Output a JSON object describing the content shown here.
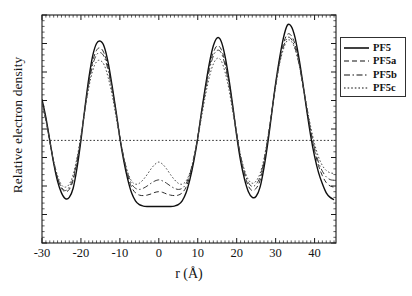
{
  "chart_data": {
    "type": "line",
    "title": "",
    "subtitle": "",
    "xlabel": "r (Å)",
    "ylabel": "Relative electron density",
    "xlim": [
      -30,
      45.5
    ],
    "ylim": [
      0,
      1.0
    ],
    "xticks": [
      -30,
      -20,
      -10,
      0,
      10,
      20,
      30,
      40
    ],
    "xtick_labels": [
      "-30",
      "-20",
      "-10",
      "0",
      "10",
      "20",
      "30",
      "40"
    ],
    "yticks": [],
    "ytick_labels": [],
    "grid": false,
    "legend_position": "outside right top",
    "reference_line": {
      "orientation": "horizontal",
      "value": 0.45,
      "style": "dotted",
      "label": ""
    },
    "x": [
      -30,
      -29,
      -28,
      -27,
      -26,
      -25,
      -24,
      -23,
      -22,
      -21,
      -20,
      -19,
      -18,
      -17,
      -16,
      -15,
      -14,
      -13,
      -12,
      -11,
      -10,
      -9,
      -8,
      -7,
      -6,
      -5,
      -4,
      -3,
      -2,
      -1,
      0,
      1,
      2,
      3,
      4,
      5,
      6,
      7,
      8,
      9,
      10,
      11,
      12,
      13,
      14,
      15,
      16,
      17,
      18,
      19,
      20,
      21,
      22,
      23,
      24,
      25,
      26,
      27,
      28,
      29,
      30,
      31,
      32,
      33,
      34,
      35,
      36,
      37,
      38,
      39,
      40,
      41,
      42,
      43,
      44,
      45
    ],
    "series": [
      {
        "name": "PF5",
        "style": "solid",
        "color": "#101010",
        "values": [
          0.63,
          0.55,
          0.45,
          0.35,
          0.27,
          0.22,
          0.195,
          0.2,
          0.24,
          0.33,
          0.45,
          0.59,
          0.72,
          0.82,
          0.875,
          0.885,
          0.86,
          0.79,
          0.69,
          0.58,
          0.46,
          0.36,
          0.28,
          0.22,
          0.185,
          0.168,
          0.162,
          0.16,
          0.16,
          0.16,
          0.16,
          0.16,
          0.16,
          0.16,
          0.162,
          0.168,
          0.185,
          0.22,
          0.28,
          0.36,
          0.46,
          0.58,
          0.69,
          0.79,
          0.865,
          0.9,
          0.885,
          0.82,
          0.72,
          0.6,
          0.47,
          0.36,
          0.28,
          0.225,
          0.2,
          0.205,
          0.245,
          0.33,
          0.44,
          0.57,
          0.7,
          0.81,
          0.9,
          0.955,
          0.95,
          0.9,
          0.81,
          0.7,
          0.58,
          0.47,
          0.38,
          0.31,
          0.26,
          0.22,
          0.2,
          0.19
        ]
      },
      {
        "name": "PF5a",
        "style": "dashed",
        "color": "#2a2a2a",
        "values": [
          0.62,
          0.545,
          0.45,
          0.355,
          0.285,
          0.24,
          0.225,
          0.235,
          0.275,
          0.355,
          0.46,
          0.585,
          0.705,
          0.795,
          0.845,
          0.855,
          0.83,
          0.77,
          0.68,
          0.575,
          0.465,
          0.37,
          0.295,
          0.245,
          0.22,
          0.21,
          0.208,
          0.21,
          0.215,
          0.222,
          0.225,
          0.222,
          0.215,
          0.21,
          0.208,
          0.21,
          0.22,
          0.245,
          0.295,
          0.37,
          0.465,
          0.575,
          0.68,
          0.775,
          0.835,
          0.865,
          0.85,
          0.795,
          0.705,
          0.595,
          0.48,
          0.375,
          0.3,
          0.25,
          0.23,
          0.24,
          0.275,
          0.35,
          0.455,
          0.575,
          0.695,
          0.8,
          0.875,
          0.915,
          0.91,
          0.87,
          0.795,
          0.695,
          0.59,
          0.49,
          0.405,
          0.34,
          0.295,
          0.265,
          0.25,
          0.245
        ]
      },
      {
        "name": "PF5b",
        "style": "dashdot",
        "color": "#3a3a3a",
        "values": [
          0.615,
          0.54,
          0.445,
          0.355,
          0.285,
          0.245,
          0.23,
          0.245,
          0.285,
          0.365,
          0.465,
          0.585,
          0.695,
          0.78,
          0.825,
          0.835,
          0.815,
          0.755,
          0.67,
          0.57,
          0.465,
          0.375,
          0.305,
          0.26,
          0.24,
          0.235,
          0.24,
          0.25,
          0.262,
          0.272,
          0.277,
          0.272,
          0.262,
          0.25,
          0.24,
          0.235,
          0.24,
          0.26,
          0.305,
          0.375,
          0.465,
          0.57,
          0.67,
          0.76,
          0.82,
          0.845,
          0.835,
          0.78,
          0.695,
          0.59,
          0.48,
          0.38,
          0.31,
          0.265,
          0.248,
          0.258,
          0.29,
          0.36,
          0.46,
          0.575,
          0.69,
          0.79,
          0.86,
          0.9,
          0.895,
          0.855,
          0.785,
          0.69,
          0.59,
          0.495,
          0.415,
          0.355,
          0.315,
          0.29,
          0.278,
          0.275
        ]
      },
      {
        "name": "PF5c",
        "style": "dotted",
        "color": "#4a4a4a",
        "values": [
          0.605,
          0.535,
          0.445,
          0.36,
          0.295,
          0.255,
          0.245,
          0.258,
          0.3,
          0.375,
          0.47,
          0.58,
          0.68,
          0.755,
          0.795,
          0.8,
          0.78,
          0.725,
          0.65,
          0.555,
          0.46,
          0.375,
          0.31,
          0.272,
          0.258,
          0.262,
          0.278,
          0.3,
          0.325,
          0.345,
          0.355,
          0.345,
          0.325,
          0.3,
          0.278,
          0.262,
          0.258,
          0.272,
          0.31,
          0.375,
          0.46,
          0.555,
          0.65,
          0.73,
          0.785,
          0.81,
          0.8,
          0.75,
          0.675,
          0.575,
          0.475,
          0.385,
          0.32,
          0.278,
          0.262,
          0.272,
          0.305,
          0.37,
          0.465,
          0.575,
          0.685,
          0.785,
          0.85,
          0.888,
          0.885,
          0.85,
          0.785,
          0.695,
          0.6,
          0.51,
          0.435,
          0.378,
          0.34,
          0.318,
          0.308,
          0.305
        ]
      }
    ],
    "legend": [
      {
        "label": "PF5",
        "style": "solid"
      },
      {
        "label": "PF5a",
        "style": "dashed"
      },
      {
        "label": "PF5b",
        "style": "dashdot"
      },
      {
        "label": "PF5c",
        "style": "dotted"
      }
    ]
  }
}
